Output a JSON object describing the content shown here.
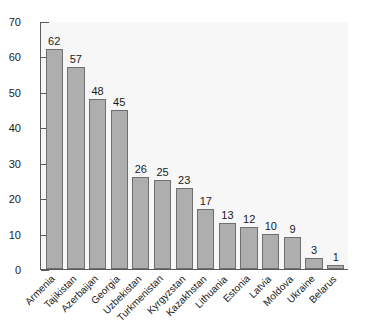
{
  "chart_data": {
    "type": "bar",
    "title": "",
    "subtitle": "",
    "xlabel": "",
    "ylabel": "",
    "ylim": [
      0,
      70
    ],
    "yticks": [
      0,
      10,
      20,
      30,
      40,
      50,
      60,
      70
    ],
    "grid": false,
    "legend": false,
    "value_labels": true,
    "categories": [
      "Armenia",
      "Tajikistan",
      "Azerbaijan",
      "Georgia",
      "Uzbekistan",
      "Turkmenistan",
      "Kyrgyzstan",
      "Kazakhstan",
      "Lithuania",
      "Estonia",
      "Latvia",
      "Moldova",
      "Ukraine",
      "Belarus"
    ],
    "values": [
      62,
      57,
      48,
      45,
      26,
      25,
      23,
      17,
      13,
      12,
      10,
      9,
      3,
      1
    ],
    "colors": {
      "bar_fill": "#aeaeae",
      "bar_stroke": "#6f6f6f",
      "plot_background": "#f7f7f8",
      "axis": "#5a5a5a",
      "text": "#1a1a1a",
      "page_background": "#ffffff"
    }
  }
}
